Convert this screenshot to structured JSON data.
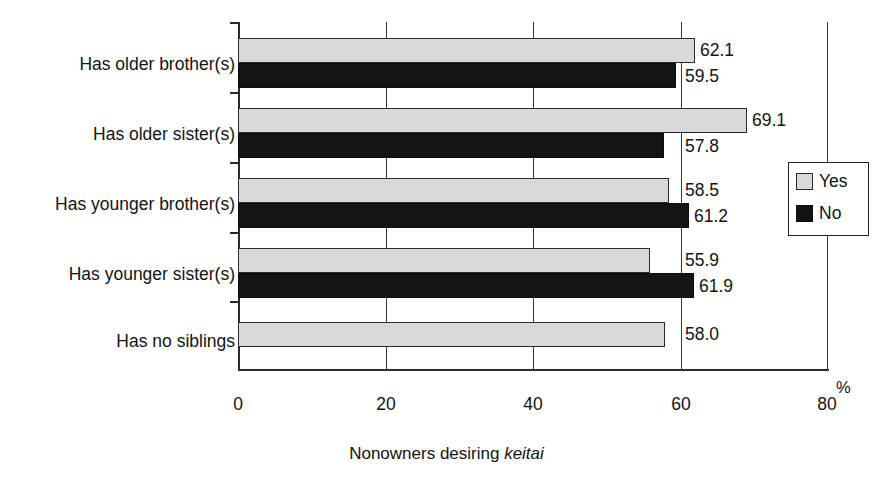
{
  "chart_data": {
    "type": "bar",
    "orientation": "horizontal",
    "title": "",
    "xlabel": "Nonowners desiring keitai",
    "xlabel_plain": "Nonowners desiring ",
    "xlabel_italic": "keitai",
    "ylabel": "",
    "unit": "%",
    "xlim": [
      0,
      80
    ],
    "xticks": [
      0,
      20,
      40,
      60,
      80
    ],
    "xtick_labels": [
      "0",
      "20",
      "40",
      "60",
      "80"
    ],
    "grid": true,
    "legend_position": "right",
    "categories": [
      "Has older brother(s)",
      "Has older sister(s)",
      "Has younger brother(s)",
      "Has younger sister(s)",
      "Has no siblings"
    ],
    "series": [
      {
        "name": "Yes",
        "color": "#d9d9d9",
        "values": [
          62.1,
          69.1,
          58.5,
          55.9,
          58.0
        ],
        "labels": [
          "62.1",
          "69.1",
          "58.5",
          "55.9",
          "58.0"
        ]
      },
      {
        "name": "No",
        "color": "#151515",
        "values": [
          59.5,
          57.8,
          61.2,
          61.9,
          null
        ],
        "labels": [
          "59.5",
          "57.8",
          "61.2",
          "61.9",
          ""
        ]
      }
    ]
  },
  "legend": {
    "items": [
      {
        "label": "Yes",
        "swatch": "yes"
      },
      {
        "label": "No",
        "swatch": "no"
      }
    ]
  },
  "axis": {
    "percent_sign": "%"
  }
}
